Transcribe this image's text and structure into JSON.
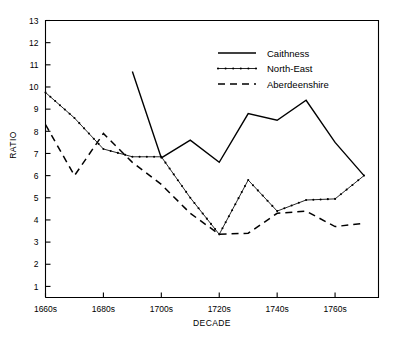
{
  "chart_data": {
    "type": "line",
    "title": "",
    "xlabel": "DECADE",
    "ylabel": "RATIO",
    "xlim": [
      1660,
      1775
    ],
    "ylim": [
      0.5,
      13
    ],
    "grid": false,
    "legend_position": "top-right",
    "x_tick_labels": [
      "1660s",
      "1680s",
      "1700s",
      "1720s",
      "1740s",
      "1760s"
    ],
    "x_tick_values": [
      1660,
      1680,
      1700,
      1720,
      1740,
      1760
    ],
    "y_tick_labels": [
      "1",
      "2",
      "3",
      "4",
      "5",
      "6",
      "7",
      "8",
      "9",
      "10",
      "11",
      "12",
      "13"
    ],
    "y_tick_values": [
      1,
      2,
      3,
      4,
      5,
      6,
      7,
      8,
      9,
      10,
      11,
      12,
      13
    ],
    "series": [
      {
        "name": "Caithness",
        "style": "solid",
        "markers": false,
        "x": [
          1690,
          1700,
          1710,
          1720,
          1730,
          1740,
          1750,
          1760,
          1770
        ],
        "values": [
          10.7,
          6.8,
          7.6,
          6.6,
          8.8,
          8.5,
          9.4,
          7.5,
          6.0
        ]
      },
      {
        "name": "North-East",
        "style": "dotted",
        "markers": true,
        "x": [
          1660,
          1670,
          1680,
          1690,
          1700,
          1710,
          1720,
          1730,
          1740,
          1750,
          1760,
          1770
        ],
        "values": [
          9.75,
          8.6,
          7.2,
          6.85,
          6.85,
          5.0,
          3.35,
          5.8,
          4.4,
          4.9,
          4.95,
          6.0
        ]
      },
      {
        "name": "Aberdeenshire",
        "style": "dashed",
        "markers": false,
        "x": [
          1660,
          1670,
          1680,
          1690,
          1700,
          1710,
          1720,
          1730,
          1740,
          1750,
          1760,
          1770
        ],
        "values": [
          8.3,
          6.0,
          7.9,
          6.6,
          5.6,
          4.3,
          3.35,
          3.4,
          4.3,
          4.4,
          3.7,
          3.85
        ]
      }
    ]
  },
  "legend": {
    "items": [
      {
        "label": "Caithness",
        "style": "solid"
      },
      {
        "label": "North-East",
        "style": "dotted"
      },
      {
        "label": "Aberdeenshire",
        "style": "dashed"
      }
    ]
  },
  "colors": {
    "ink": "#000000",
    "background": "#ffffff"
  }
}
